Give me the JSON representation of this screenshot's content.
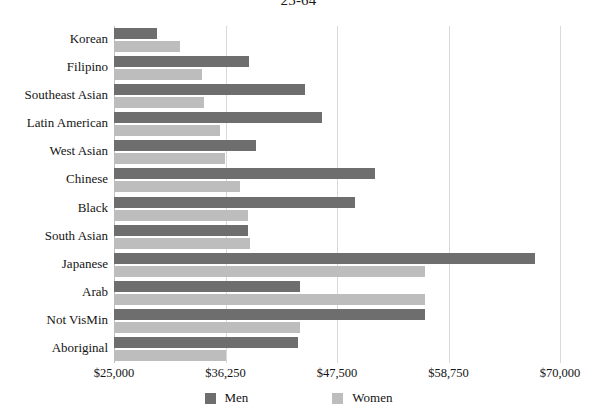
{
  "chart_data": {
    "type": "bar",
    "orientation": "horizontal",
    "title": "25-64",
    "xlabel": "",
    "ylabel": "",
    "xlim": [
      25000,
      70000
    ],
    "xticks": [
      "$25,000",
      "$36,250",
      "$47,500",
      "$58,750",
      "$70,000"
    ],
    "xtick_values": [
      25000,
      36250,
      47500,
      58750,
      70000
    ],
    "grid": true,
    "legend_position": "bottom",
    "categories": [
      "Korean",
      "Filipino",
      "Southeast Asian",
      "Latin American",
      "West Asian",
      "Chinese",
      "Black",
      "South Asian",
      "Japanese",
      "Arab",
      "Not VisMin",
      "Aboriginal"
    ],
    "series": [
      {
        "name": "Men",
        "color": "#6e6e6e",
        "values": [
          29300,
          38600,
          44300,
          46000,
          39300,
          51300,
          49300,
          38500,
          67500,
          43800,
          56400,
          43600
        ]
      },
      {
        "name": "Women",
        "color": "#bdbdbd",
        "values": [
          31700,
          33900,
          34100,
          35700,
          36200,
          37700,
          38500,
          38700,
          56400,
          56400,
          43800,
          36300
        ]
      }
    ]
  },
  "legend": {
    "items": [
      {
        "label": "Men",
        "color": "#6e6e6e"
      },
      {
        "label": "Women",
        "color": "#bdbdbd"
      }
    ]
  }
}
